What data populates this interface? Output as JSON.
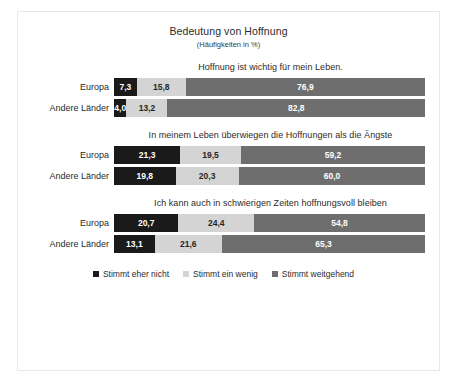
{
  "chart_data": {
    "type": "bar",
    "orientation": "horizontal",
    "stacked": true,
    "stacked_percent": true,
    "title": "Bedeutung von Hoffnung",
    "subtitle": "(Häufigkeiten in %)",
    "xlabel": "",
    "ylabel": "",
    "xlim": [
      0,
      100
    ],
    "grid": false,
    "legend_position": "bottom",
    "legend": [
      "Stimmt eher nicht",
      "Stimmt ein wenig",
      "Stimmt weitgehend"
    ],
    "series_colors": [
      "#1a1a1a",
      "#d4d4d4",
      "#6e6e6e"
    ],
    "categories": [
      "Europa",
      "Andere Länder"
    ],
    "panels": [
      {
        "title": "Hoffnung ist wichtig für mein Leben.",
        "rows": [
          {
            "category": "Europa",
            "values": [
              7.3,
              15.8,
              76.9
            ],
            "labels": [
              "7,3",
              "15,8",
              "76,9"
            ]
          },
          {
            "category": "Andere Länder",
            "values": [
              4.0,
              13.2,
              82.8
            ],
            "labels": [
              "4,0",
              "13,2",
              "82,8"
            ]
          }
        ]
      },
      {
        "title": "In meinem Leben überwiegen die Hoffnungen als die Ängste",
        "rows": [
          {
            "category": "Europa",
            "values": [
              21.3,
              19.5,
              59.2
            ],
            "labels": [
              "21,3",
              "19,5",
              "59,2"
            ]
          },
          {
            "category": "Andere Länder",
            "values": [
              19.8,
              20.3,
              60.0
            ],
            "labels": [
              "19,8",
              "20,3",
              "60,0"
            ]
          }
        ]
      },
      {
        "title": "Ich kann auch in schwierigen Zeiten hoffnungsvoll bleiben",
        "rows": [
          {
            "category": "Europa",
            "values": [
              20.7,
              24.4,
              54.8
            ],
            "labels": [
              "20,7",
              "24,4",
              "54,8"
            ]
          },
          {
            "category": "Andere Länder",
            "values": [
              13.1,
              21.6,
              65.3
            ],
            "labels": [
              "13,1",
              "21,6",
              "65,3"
            ]
          }
        ]
      }
    ]
  }
}
